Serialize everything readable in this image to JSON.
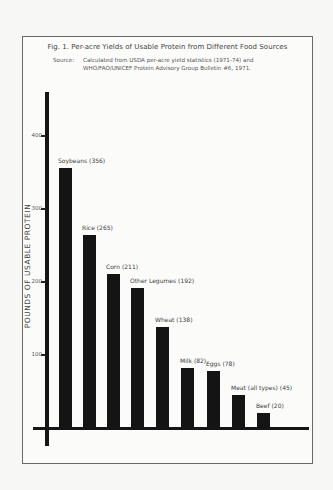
{
  "chart_data": {
    "type": "bar",
    "title": "Fig. 1. Per-acre Yields of Usable Protein from Different Food Sources",
    "subtitle_label": "Source:",
    "subtitle_lines": [
      "Calculated from USDA per-acre yield statistics (1971-74) and",
      "WHO/FAO/UNICEF Protein Advisory Group Bulletin #6, 1971."
    ],
    "xlabel": "",
    "ylabel": "POUNDS OF USABLE PROTEIN",
    "ylim": [
      0,
      450
    ],
    "yticks": [
      100,
      200,
      300,
      400
    ],
    "grid": false,
    "legend": null,
    "categories": [
      "Soybeans",
      "Rice",
      "Corn",
      "Other Legumes",
      "Wheat",
      "Milk",
      "Eggs",
      "Meat (all types)",
      "Beef"
    ],
    "values": [
      356,
      265,
      211,
      192,
      138,
      82,
      78,
      45,
      20
    ],
    "bar_labels": [
      "Soybeans (356)",
      "Rice (265)",
      "Corn (211)",
      "Other Legumes (192)",
      "Wheat (138)",
      "Milk (82)",
      "Eggs (78)",
      "Meat (all types) (45)",
      "Beef (20)"
    ],
    "bar_color": "#141414"
  }
}
